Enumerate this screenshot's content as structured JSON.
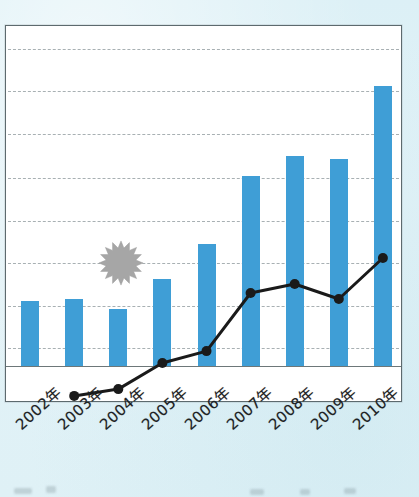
{
  "chart_data": {
    "type": "bar",
    "title": "",
    "subtitle": "",
    "xlabel": "",
    "ylabel": "",
    "grid": true,
    "legend_position": "none",
    "axis": {
      "ymin": 0,
      "ymax": 8,
      "gridline_count": 8,
      "tick_labels_visible": false
    },
    "categories": [
      "2002年",
      "2003年",
      "2004年",
      "2005年",
      "2006年",
      "2007年",
      "2008年",
      "2009年",
      "2010年"
    ],
    "series": [
      {
        "name": "柱形系列",
        "type": "bar",
        "color": "#3f9ed6",
        "values": [
          1.52,
          1.57,
          1.33,
          2.04,
          2.86,
          4.45,
          4.92,
          4.85,
          6.56
        ]
      },
      {
        "name": "折线系列",
        "type": "line",
        "color": "#1a1a1a",
        "marker": "circle",
        "values": [
          null,
          -0.7,
          -0.54,
          0.07,
          0.35,
          1.71,
          1.92,
          1.57,
          2.53
        ]
      }
    ],
    "annotations": [
      {
        "name": "starburst",
        "shape": "sunburst-16-point",
        "color": "#a6a6a6",
        "near_category": "2004年"
      }
    ]
  },
  "x_axis_labels": [
    {
      "text": "2002年"
    },
    {
      "text": "2003年"
    },
    {
      "text": "2004年"
    },
    {
      "text": "2005年"
    },
    {
      "text": "2006年"
    },
    {
      "text": "2007年"
    },
    {
      "text": "2008年"
    },
    {
      "text": "2009年"
    },
    {
      "text": "2010年"
    }
  ],
  "colors": {
    "bar": "#3f9ed6",
    "line": "#1a1a1a",
    "grid": "#9aa3a6",
    "frame": "#5d6a6e",
    "page_background": "#dff1f5",
    "plot_background": "#ffffff",
    "starburst": "#a6a6a6"
  }
}
